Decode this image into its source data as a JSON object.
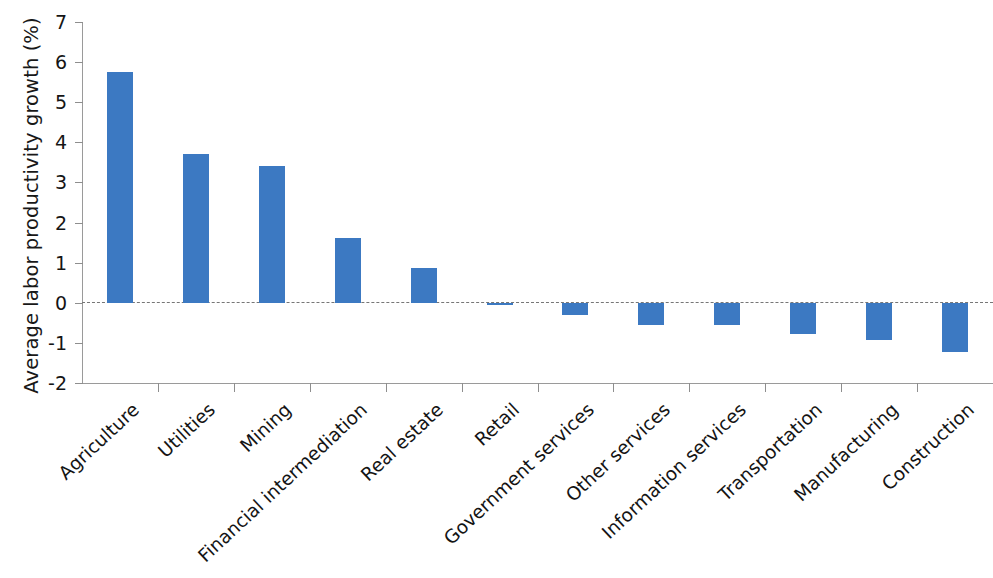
{
  "chart_data": {
    "type": "bar",
    "title": "",
    "xlabel": "",
    "ylabel": "Average labor productivity growth (%)",
    "ylim": [
      -2,
      7
    ],
    "ytick_labels": [
      "7",
      "6",
      "5",
      "4",
      "3",
      "2",
      "1",
      "0",
      "-1",
      "-2"
    ],
    "yticks": [
      7,
      6,
      5,
      4,
      3,
      2,
      1,
      0,
      -1,
      -2
    ],
    "grid": false,
    "legend": null,
    "zero_reference_line": true,
    "bar_color": "#3c79c2",
    "categories": [
      "Agriculture",
      "Utilities",
      "Mining",
      "Financial intermediation",
      "Real estate",
      "Retail",
      "Government services",
      "Other services",
      "Information services",
      "Transportation",
      "Manufacturing",
      "Construction"
    ],
    "values": [
      5.75,
      3.72,
      3.42,
      1.62,
      0.87,
      -0.05,
      -0.3,
      -0.55,
      -0.55,
      -0.78,
      -0.92,
      -1.22
    ]
  }
}
